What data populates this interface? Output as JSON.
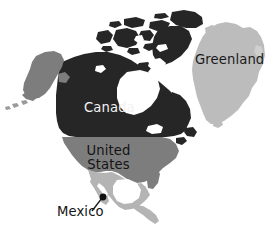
{
  "figure": {
    "background_color": "#ffffff",
    "width": 270,
    "height": 235
  },
  "palette": {
    "canada_fill": "#262626",
    "united_states_fill": "#7d7d7d",
    "mexico_fill": "#b4b4b4",
    "greenland_fill": "#bcbcbc",
    "water_fill": "#ffffff",
    "label_light": "#f2f2f2",
    "label_dark": "#141414",
    "leader_line_color": "#1a1a1a"
  },
  "labels": {
    "canada": "Canada",
    "united_states_line1": "United",
    "united_states_line2": "States",
    "greenland": "Greenland",
    "mexico": "Mexico"
  },
  "regions": [
    {
      "name": "Canada",
      "label": "Canada",
      "shade": "dark",
      "fill": "#262626"
    },
    {
      "name": "United States",
      "label": "United States",
      "shade": "medium",
      "fill": "#7d7d7d"
    },
    {
      "name": "Mexico",
      "label": "Mexico",
      "shade": "light",
      "fill": "#b4b4b4"
    },
    {
      "name": "Greenland",
      "label": "Greenland",
      "shade": "light",
      "fill": "#bcbcbc"
    }
  ],
  "annotation": {
    "mexico_marker": {
      "x": 103,
      "y": 197,
      "radius": 3.4
    },
    "mexico_leader_line": {
      "x1": 92,
      "y1": 211,
      "x2": 102,
      "y2": 198
    }
  }
}
